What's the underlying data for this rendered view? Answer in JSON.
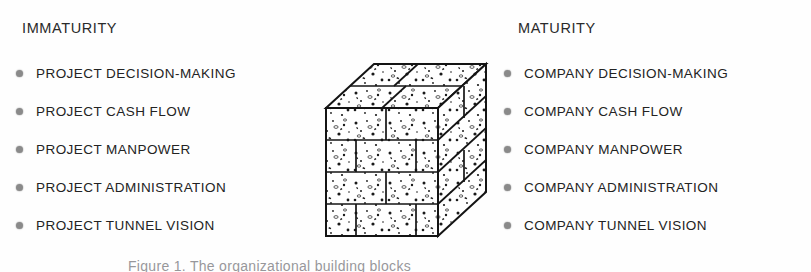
{
  "figure": {
    "caption": "Figure 1. The organizational building blocks",
    "background_color": "#fefefe",
    "text_color": "#232323",
    "bullet_color": "#8a8a8a"
  },
  "columns": {
    "left": {
      "heading": "IMMATURITY",
      "items": [
        {
          "bullet": "bullet-dot-icon",
          "label": "PROJECT DECISION-MAKING"
        },
        {
          "bullet": "bullet-dot-icon",
          "label": "PROJECT CASH FLOW"
        },
        {
          "bullet": "bullet-dot-icon",
          "label": "PROJECT MANPOWER"
        },
        {
          "bullet": "bullet-dot-icon",
          "label": "PROJECT ADMINISTRATION"
        },
        {
          "bullet": "bullet-dot-icon",
          "label": "PROJECT TUNNEL VISION"
        }
      ]
    },
    "right": {
      "heading": "MATURITY",
      "items": [
        {
          "bullet": "bullet-dot-icon",
          "label": "COMPANY DECISION-MAKING"
        },
        {
          "bullet": "bullet-dot-icon",
          "label": "COMPANY CASH FLOW"
        },
        {
          "bullet": "bullet-dot-icon",
          "label": "COMPANY MANPOWER"
        },
        {
          "bullet": "bullet-dot-icon",
          "label": "COMPANY ADMINISTRATION"
        },
        {
          "bullet": "bullet-dot-icon",
          "label": "COMPANY TUNNEL VISION"
        }
      ]
    }
  },
  "illustration": {
    "name": "isometric-brick-cube-illustration",
    "description": "Isometric cube built of speckled concrete blocks laid in staggered courses",
    "line_color": "#141414",
    "fill_color": "#ffffff",
    "speckle_color": "#1a1a1a"
  }
}
